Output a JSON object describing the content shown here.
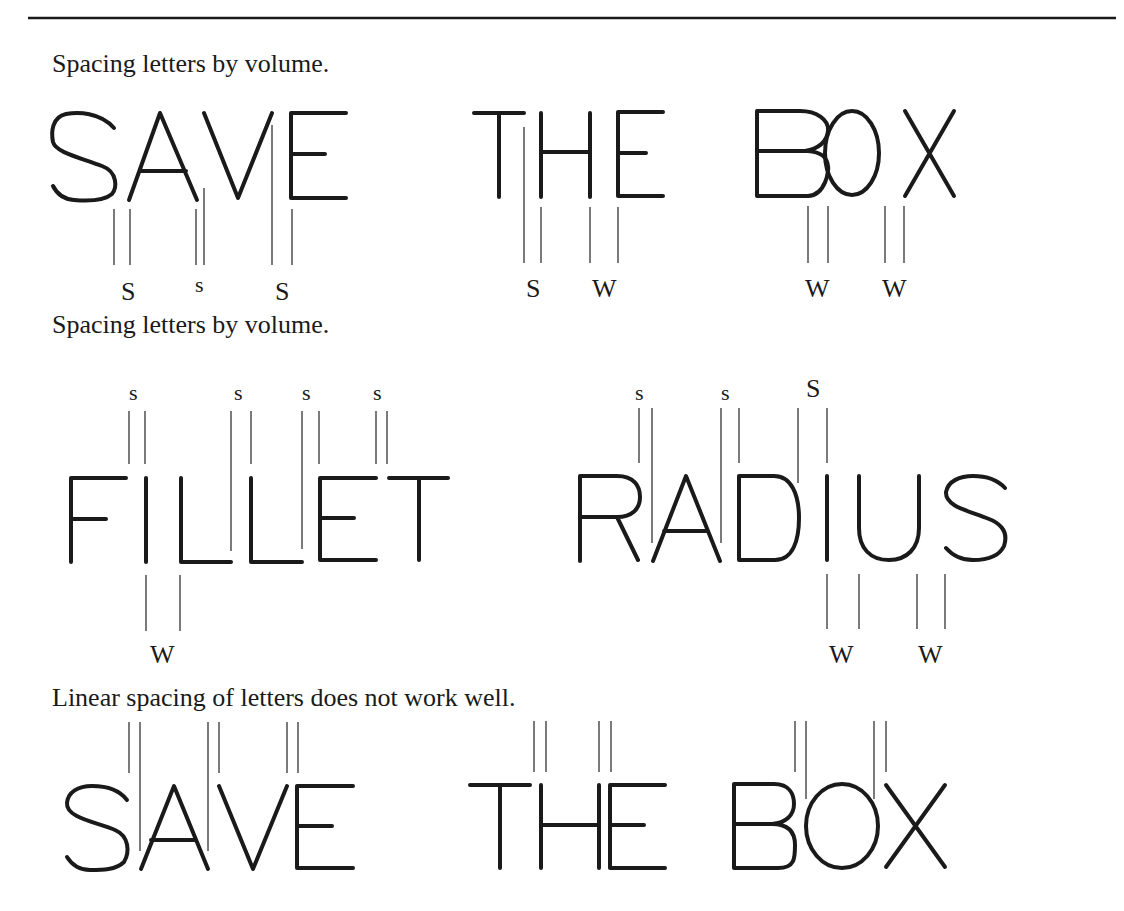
{
  "figure": {
    "colors": {
      "ink": "#1a1a1a",
      "guide": "#333333",
      "background": "#ffffff"
    },
    "legend_meaning": {
      "s": "spaced closer (narrow space)",
      "w": "spaced wider (wide space)"
    },
    "example1": {
      "caption": "Spacing letters by volume.",
      "words": [
        "SAVE",
        "THE",
        "BOX"
      ],
      "labels": [
        {
          "text": "S",
          "x": 129,
          "y": 300,
          "size": 26
        },
        {
          "text": "s",
          "x": 213,
          "y": 292,
          "size": 22
        },
        {
          "text": "S",
          "x": 302,
          "y": 300,
          "size": 26
        },
        {
          "text": "S",
          "x": 552,
          "y": 297,
          "size": 26
        },
        {
          "text": "W",
          "x": 646,
          "y": 297,
          "size": 26
        },
        {
          "text": "W",
          "x": 913,
          "y": 297,
          "size": 26
        },
        {
          "text": "W",
          "x": 1012,
          "y": 297,
          "size": 26
        }
      ]
    },
    "example2": {
      "caption": "Spacing letters by volume.",
      "words": [
        "FILLET",
        "RADIUS"
      ],
      "labels": [
        {
          "text": "s",
          "x": 146,
          "y": 400,
          "size": 22
        },
        {
          "text": "s",
          "x": 257,
          "y": 400,
          "size": 22
        },
        {
          "text": "s",
          "x": 330,
          "y": 400,
          "size": 22
        },
        {
          "text": "s",
          "x": 407,
          "y": 400,
          "size": 22
        },
        {
          "text": "W",
          "x": 176,
          "y": 663,
          "size": 26
        },
        {
          "text": "s",
          "x": 650,
          "y": 400,
          "size": 22
        },
        {
          "text": "s",
          "x": 740,
          "y": 400,
          "size": 22
        },
        {
          "text": "S",
          "x": 834,
          "y": 397,
          "size": 26
        },
        {
          "text": "W",
          "x": 866,
          "y": 663,
          "size": 26
        },
        {
          "text": "W",
          "x": 959,
          "y": 663,
          "size": 26
        }
      ]
    },
    "example3": {
      "caption": "Linear spacing of letters does not work well.",
      "words": [
        "SAVE",
        "THE",
        "BOX"
      ]
    }
  }
}
